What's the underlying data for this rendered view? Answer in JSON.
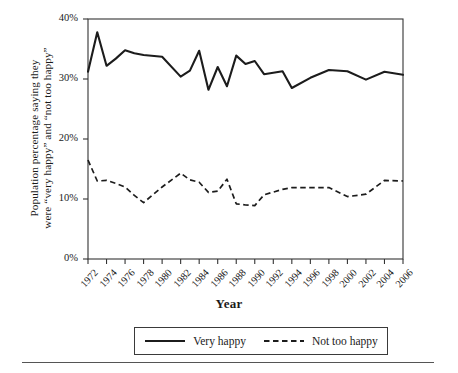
{
  "chart_data": {
    "type": "line",
    "title": "",
    "xlabel": "Year",
    "ylabel": "Population percentage saying they were “very happy” and “not too happy”",
    "ylabel_line1": "Population percentage saying they",
    "ylabel_line2": "were “very happy” and “not too happy”",
    "ylim": [
      0,
      40
    ],
    "yticks": [
      0,
      10,
      20,
      30,
      40
    ],
    "ytick_labels": [
      "0%",
      "10%",
      "20%",
      "30%",
      "40%"
    ],
    "xlim": [
      1972,
      2006
    ],
    "xticks": [
      1972,
      1974,
      1976,
      1978,
      1980,
      1982,
      1984,
      1986,
      1988,
      1990,
      1992,
      1994,
      1996,
      1998,
      2000,
      2002,
      2004,
      2006
    ],
    "xtick_labels": [
      "1972",
      "1974",
      "1976",
      "1978",
      "1980",
      "1982",
      "1984",
      "1986",
      "1988",
      "1990",
      "1992",
      "1994",
      "1996",
      "1998",
      "2000",
      "2002",
      "2004",
      "2006"
    ],
    "grid": false,
    "legend_position": "below-plot",
    "x": [
      1972,
      1973,
      1974,
      1975,
      1976,
      1977,
      1978,
      1980,
      1982,
      1983,
      1984,
      1985,
      1986,
      1987,
      1988,
      1989,
      1990,
      1991,
      1993,
      1994,
      1996,
      1998,
      2000,
      2002,
      2004,
      2006
    ],
    "series": [
      {
        "name": "Very happy",
        "style": "solid",
        "color": "#1c1c1c",
        "values": [
          31.2,
          37.8,
          32.2,
          33.4,
          34.8,
          34.3,
          34.0,
          33.7,
          30.4,
          31.4,
          34.7,
          28.2,
          32.0,
          28.8,
          33.9,
          32.5,
          33.0,
          30.8,
          31.3,
          28.5,
          30.2,
          31.5,
          31.3,
          29.9,
          31.2,
          30.7
        ]
      },
      {
        "name": "Not too happy",
        "style": "dashed",
        "color": "#1c1c1c",
        "values": [
          16.5,
          13.0,
          13.1,
          12.6,
          12.0,
          10.6,
          9.4,
          12.0,
          14.3,
          13.2,
          12.8,
          11.1,
          11.3,
          13.3,
          9.2,
          9.0,
          8.9,
          10.7,
          11.6,
          11.9,
          11.9,
          11.9,
          10.4,
          10.8,
          13.1,
          13.0
        ]
      }
    ],
    "geometry": {
      "plot_left": 88,
      "plot_right": 403,
      "plot_top": 19,
      "plot_bottom": 259
    }
  },
  "legend": {
    "items": [
      {
        "label": "Very happy",
        "style": "solid"
      },
      {
        "label": "Not too happy",
        "style": "dashed"
      }
    ]
  }
}
